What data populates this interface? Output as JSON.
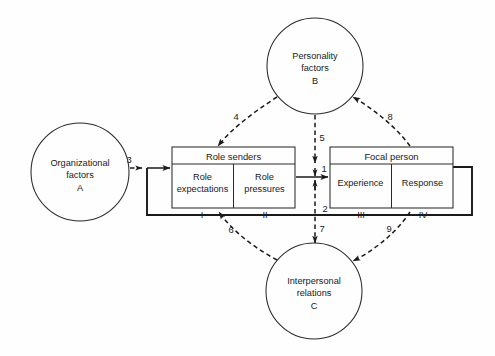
{
  "diagram": {
    "background_color": "#fefefe",
    "line_color": "#1a1a1a",
    "circles": [
      {
        "id": "organizational-factors",
        "lines": [
          "Organizational",
          "factors"
        ],
        "letter": "A",
        "cx": 80,
        "cy": 172,
        "r": 49
      },
      {
        "id": "personality-factors",
        "lines": [
          "Personality",
          "factors"
        ],
        "letter": "B",
        "cx": 315,
        "cy": 66,
        "r": 48
      },
      {
        "id": "interpersonal-relations",
        "lines": [
          "Interpersonal",
          "relations"
        ],
        "letter": "C",
        "cx": 314,
        "cy": 291,
        "r": 48
      }
    ],
    "boxes": [
      {
        "id": "role-senders",
        "title": "Role senders",
        "x": 172,
        "y": 147,
        "w": 123,
        "h": 61,
        "header_h": 17,
        "cells": [
          {
            "id": "role-expectations",
            "lines": [
              "Role",
              "expectations"
            ],
            "roman": "I"
          },
          {
            "id": "role-pressures",
            "lines": [
              "Role",
              "pressures"
            ],
            "roman": "II"
          }
        ]
      },
      {
        "id": "focal-person",
        "title": "Focal person",
        "x": 330,
        "y": 147,
        "w": 123,
        "h": 61,
        "header_h": 17,
        "cells": [
          {
            "id": "experience",
            "lines": [
              "Experience"
            ],
            "roman": "III"
          },
          {
            "id": "response",
            "lines": [
              "Response"
            ],
            "roman": "IV"
          }
        ]
      }
    ],
    "arrow_labels": [
      {
        "id": "arrow-3",
        "value": "3",
        "x": 129,
        "y": 163,
        "kind": "dashed",
        "from": "organizational-factors",
        "to": "role-senders"
      },
      {
        "id": "arrow-4",
        "value": "4",
        "x": 236,
        "y": 120,
        "kind": "dashed",
        "from": "personality-factors",
        "to": "role-senders"
      },
      {
        "id": "arrow-5",
        "value": "5",
        "x": 322,
        "y": 141,
        "kind": "dashed",
        "from": "personality-factors",
        "to": "focal-person"
      },
      {
        "id": "arrow-8",
        "value": "8",
        "x": 390,
        "y": 120,
        "kind": "dashed",
        "from": "focal-person",
        "to": "personality-factors"
      },
      {
        "id": "arrow-1",
        "value": "1",
        "x": 323,
        "y": 170,
        "kind": "solid",
        "from": "role-senders",
        "to": "focal-person"
      },
      {
        "id": "arrow-2",
        "value": "2",
        "x": 325,
        "y": 214,
        "kind": "solid",
        "from": "focal-person",
        "to": "role-senders"
      },
      {
        "id": "arrow-6",
        "value": "6",
        "x": 230,
        "y": 232,
        "kind": "dashed",
        "from": "interpersonal-relations",
        "to": "role-senders"
      },
      {
        "id": "arrow-7",
        "value": "7",
        "x": 322,
        "y": 232,
        "kind": "dashed",
        "from": "focal-person",
        "to": "interpersonal-relations"
      },
      {
        "id": "arrow-9",
        "value": "9",
        "x": 390,
        "y": 232,
        "kind": "dashed",
        "from": "focal-person",
        "to": "interpersonal-relations"
      }
    ]
  }
}
